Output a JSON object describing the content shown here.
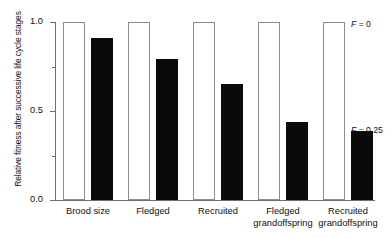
{
  "chart_data": {
    "type": "bar",
    "title": "",
    "xlabel": "",
    "ylabel": "Relative fitness after successive life cycle stages",
    "ylim": [
      0.0,
      1.0
    ],
    "ytick_labels": [
      "1.0",
      "0.5",
      "0.0"
    ],
    "ytick_values": [
      1.0,
      0.5,
      0.0
    ],
    "yminor_values": [
      0.75,
      0.25
    ],
    "grid": false,
    "legend_position": "inline-annotation",
    "categories": [
      "Brood size",
      "Fledged",
      "Recruited",
      "Fledged grandoffspring",
      "Recruited grandoffspring"
    ],
    "category_lines": [
      [
        "Brood size"
      ],
      [
        "Fledged"
      ],
      [
        "Recruited"
      ],
      [
        "Fledged",
        "grandoffspring"
      ],
      [
        "Recruited",
        "grandoffspring"
      ]
    ],
    "series": [
      {
        "name": "F = 0",
        "style": "open",
        "values": [
          1.0,
          1.0,
          1.0,
          1.0,
          1.0
        ]
      },
      {
        "name": "F = 0.25",
        "style": "filled",
        "values": [
          0.91,
          0.79,
          0.65,
          0.44,
          0.385
        ]
      }
    ],
    "annotations": [
      {
        "text_prefix": "F",
        "text_rest": " = 0",
        "series": "F = 0",
        "value": 1.0
      },
      {
        "text_prefix": "F",
        "text_rest": " = 0.25",
        "series": "F = 0.25",
        "value": 0.385
      }
    ]
  }
}
